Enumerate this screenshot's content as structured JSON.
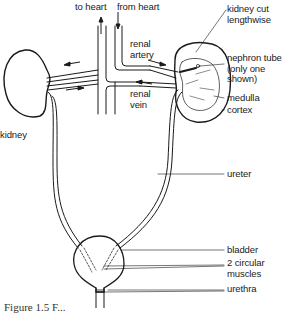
{
  "figure": {
    "labels": {
      "to_heart": "to heart",
      "from_heart": "from heart",
      "renal_artery": [
        "renal",
        "artery"
      ],
      "renal_vein": [
        "renal",
        "vein"
      ],
      "kidney": "kidney",
      "kidney_cut": [
        "kidney cut",
        "lengthwise"
      ],
      "nephron_tube": [
        "nephron tube",
        "(only one",
        "shown)"
      ],
      "medulla": "medulla",
      "cortex": "cortex",
      "ureter": "ureter",
      "bladder": "bladder",
      "circular_muscles": [
        "2 circular",
        "muscles"
      ],
      "urethra": "urethra"
    },
    "caption": "Figure 1.5 F..."
  },
  "colors": {
    "line": "#1a1a1a",
    "background": "#ffffff"
  }
}
